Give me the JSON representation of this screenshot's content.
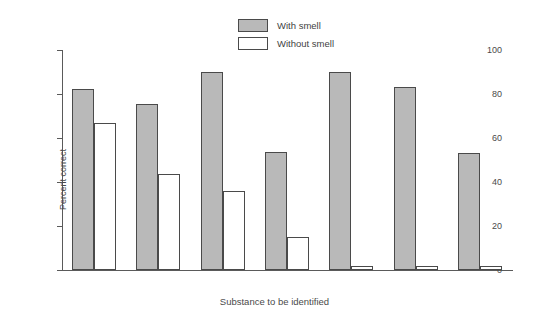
{
  "chart_data": {
    "type": "bar",
    "title": "",
    "xlabel": "Substance to be identified",
    "ylabel": "Percent correct",
    "ylim": [
      0,
      100
    ],
    "yticks": [
      0,
      20,
      40,
      60,
      80,
      100
    ],
    "grid": false,
    "legend_position": "top-center",
    "categories": [
      "Water",
      "Vinegar",
      "Whiskey",
      "Wine",
      "Coffee",
      "Chocolate",
      "Garlic"
    ],
    "series": [
      {
        "name": "With smell",
        "values": [
          82.5,
          75.5,
          90.0,
          53.5,
          90.0,
          83.0,
          53.0
        ]
      },
      {
        "name": "Without smell",
        "values": [
          67.0,
          43.5,
          36.0,
          15.0,
          2.0,
          2.0,
          2.0
        ]
      }
    ]
  },
  "legend": {
    "items": [
      {
        "label": "With smell",
        "swatch": "filled-gray-swatch"
      },
      {
        "label": "Without smell",
        "swatch": "empty-white-swatch"
      }
    ]
  },
  "colors": {
    "with_smell_fill": "#b9b9b9",
    "without_smell_fill": "#ffffff",
    "bar_outline": "#4a4a4a",
    "axis": "#5a5a5a",
    "text": "#4a4a4a",
    "background": "#ffffff"
  }
}
